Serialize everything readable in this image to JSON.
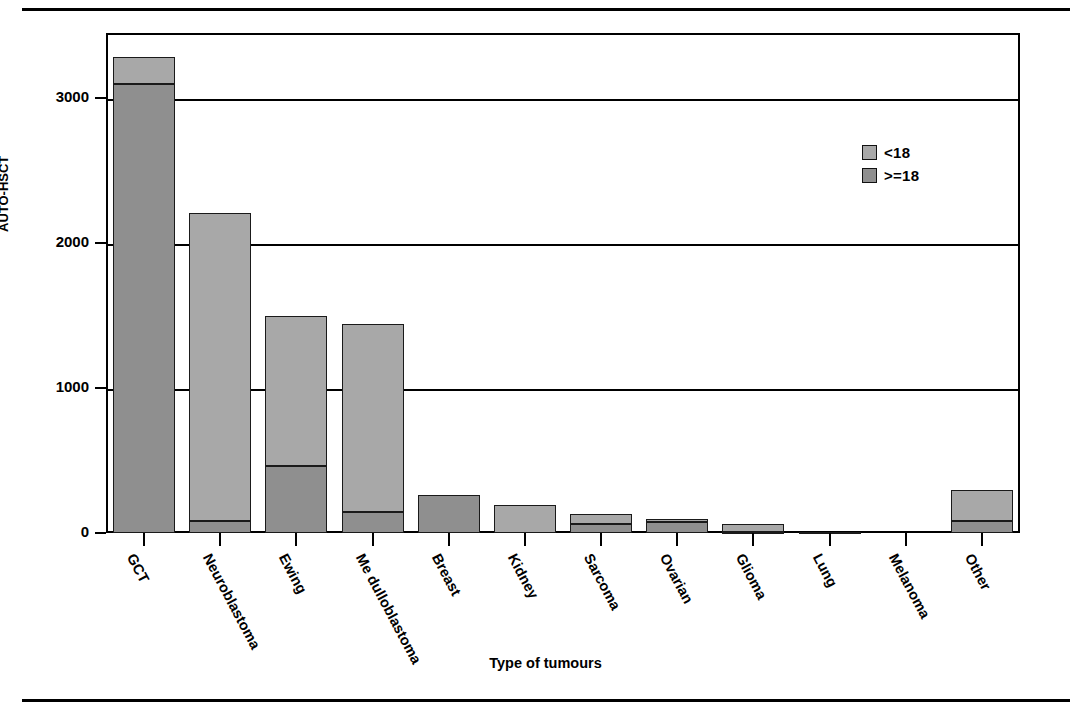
{
  "chart_data": {
    "type": "bar",
    "subtype": "stacked-bar",
    "title": "",
    "xlabel": "Type of tumours",
    "ylabel": "AUTO-HSCT",
    "categories": [
      "GCT",
      "Neuroblastoma",
      "Ewing",
      "Me dulloblastoma",
      "Breast",
      "Kidney",
      "Sarcoma",
      "Ovarian",
      "Glioma",
      "Lung",
      "Melanoma",
      "Other"
    ],
    "series": [
      {
        "name": ">=18",
        "color": "#8f8f8f",
        "values": [
          3100,
          80,
          460,
          145,
          265,
          0,
          60,
          75,
          10,
          5,
          0,
          80
        ]
      },
      {
        "name": "<18",
        "color": "#a8a8a8",
        "values": [
          185,
          2125,
          1040,
          1300,
          0,
          195,
          70,
          20,
          50,
          5,
          0,
          220
        ]
      }
    ],
    "totals": [
      3285,
      2205,
      1500,
      1445,
      265,
      195,
      130,
      95,
      60,
      10,
      0,
      300
    ],
    "ylim": [
      0,
      3450
    ],
    "yticks": [
      0,
      1000,
      2000,
      3000
    ],
    "ytick_labels": [
      "0",
      "1000",
      "2000",
      "3000"
    ],
    "grid": true,
    "grid_axis": "y",
    "legend_position": "top-right",
    "legend_entries": [
      "<18",
      ">=18"
    ]
  },
  "legend": {
    "items": [
      {
        "label": "<18",
        "color": "#a8a8a8"
      },
      {
        "label": ">=18",
        "color": "#8f8f8f"
      }
    ]
  },
  "axes": {
    "y_title": "AUTO-HSCT",
    "x_title": "Type of tumours",
    "y_ticks": [
      "3000",
      "2000",
      "1000",
      "0"
    ]
  }
}
